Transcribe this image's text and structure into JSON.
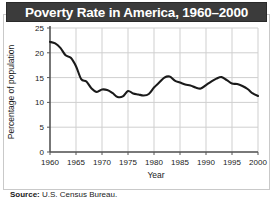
{
  "figure": {
    "title": "Poverty Rate in America, 1960–2000",
    "source_label": "Source:",
    "source_text": "U.S. Census Bureau.",
    "colors": {
      "title_bar_background": "#3b3b3b",
      "title_text": "#ffffff",
      "frame_border": "#c9c9c9",
      "grid": "#cfcfcf",
      "axis": "#555555",
      "line": "#1a1a1a",
      "page_background": "#ffffff"
    }
  },
  "chart_data": {
    "type": "line",
    "title": "Poverty Rate in America, 1960–2000",
    "xlabel": "Year",
    "ylabel": "Percentage of population",
    "xlim": [
      1960,
      2000
    ],
    "ylim": [
      0,
      25
    ],
    "grid": true,
    "legend": "none",
    "xticks": [
      "1960",
      "1965",
      "1970",
      "1975",
      "1980",
      "1985",
      "1990",
      "1995",
      "2000"
    ],
    "yticks": [
      "0",
      "5",
      "10",
      "15",
      "20",
      "25"
    ],
    "x": [
      1960,
      1961,
      1962,
      1963,
      1964,
      1965,
      1966,
      1967,
      1968,
      1969,
      1970,
      1971,
      1972,
      1973,
      1974,
      1975,
      1976,
      1977,
      1978,
      1979,
      1980,
      1981,
      1982,
      1983,
      1984,
      1985,
      1986,
      1987,
      1988,
      1989,
      1990,
      1991,
      1992,
      1993,
      1994,
      1995,
      1996,
      1997,
      1998,
      1999,
      2000
    ],
    "values": [
      22.2,
      21.9,
      21.0,
      19.5,
      19.0,
      17.3,
      14.7,
      14.2,
      12.8,
      12.1,
      12.6,
      12.5,
      11.9,
      11.1,
      11.2,
      12.3,
      11.8,
      11.6,
      11.4,
      11.7,
      13.0,
      14.0,
      15.0,
      15.2,
      14.4,
      14.0,
      13.6,
      13.4,
      13.0,
      12.8,
      13.5,
      14.2,
      14.8,
      15.1,
      14.5,
      13.8,
      13.7,
      13.3,
      12.7,
      11.8,
      11.3
    ]
  }
}
